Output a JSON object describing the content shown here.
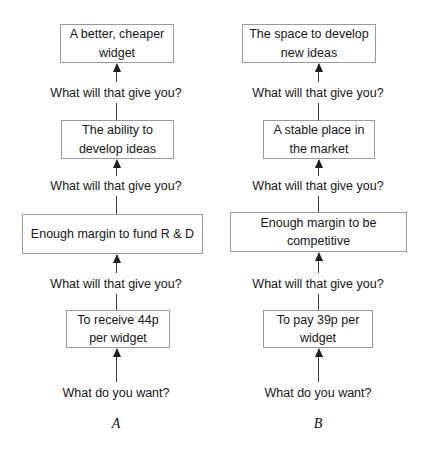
{
  "diagram": {
    "columns": [
      {
        "caption": "A",
        "nodes": [
          {
            "text": "A better, cheaper widget"
          },
          {
            "text": "The ability to develop ideas"
          },
          {
            "text": "Enough margin to fund R & D"
          },
          {
            "text": "To receive 44p per widget"
          }
        ],
        "questions": [
          {
            "text": "What will that give you?"
          },
          {
            "text": "What will that give you?"
          },
          {
            "text": "What will that give you?"
          },
          {
            "text": "What do you want?"
          }
        ]
      },
      {
        "caption": "B",
        "nodes": [
          {
            "text": "The space to develop new ideas"
          },
          {
            "text": "A stable place in the market"
          },
          {
            "text": "Enough margin to be competitive"
          },
          {
            "text": "To pay 39p per widget"
          }
        ],
        "questions": [
          {
            "text": "What will that give you?"
          },
          {
            "text": "What will that give you?"
          },
          {
            "text": "What will that give you?"
          },
          {
            "text": "What do you want?"
          }
        ]
      }
    ]
  }
}
